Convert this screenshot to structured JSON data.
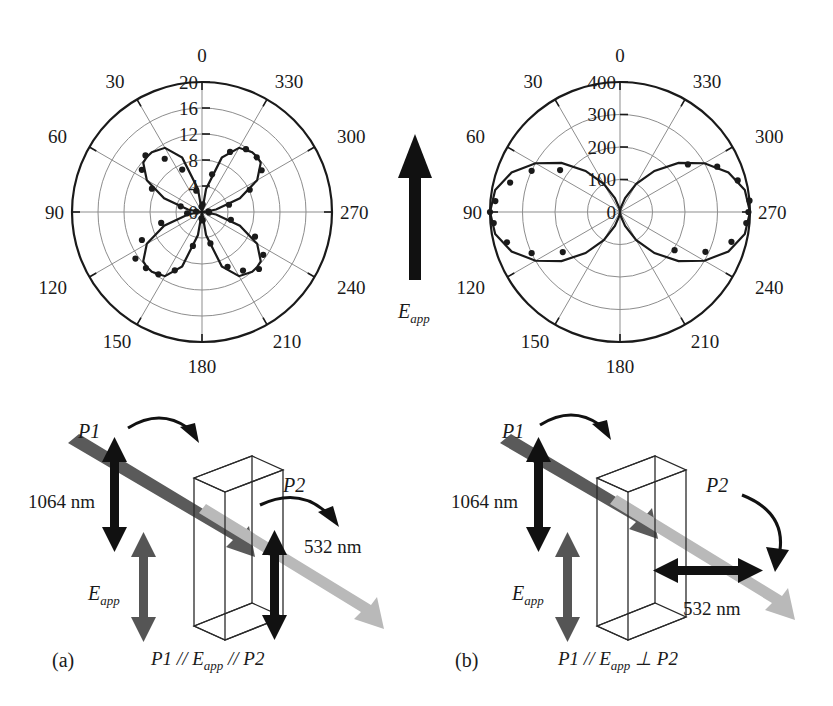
{
  "figure": {
    "panels": [
      {
        "id": "a",
        "panel_label": "(a)",
        "caption_main": "P1 // E",
        "caption_sub": "app",
        "caption_tail": " // P2",
        "p1_label": "P1",
        "p2_label": "P2",
        "eapp_label": "E",
        "eapp_sub": "app",
        "input_wavelength": "1064 nm",
        "output_wavelength": "532 nm",
        "p2_orientation": "vertical"
      },
      {
        "id": "b",
        "panel_label": "(b)",
        "caption_main": "P1 // E",
        "caption_sub": "app",
        "caption_tail": " ⊥ P2",
        "p1_label": "P1",
        "p2_label": "P2",
        "eapp_label": "E",
        "eapp_sub": "app",
        "input_wavelength": "1064 nm",
        "output_wavelength": "532 nm",
        "p2_orientation": "horizontal"
      }
    ],
    "center_arrow": {
      "label": "E",
      "sub": "app",
      "direction": "up"
    },
    "colors": {
      "ink": "#1a1a1a",
      "grid": "#8d8d8d",
      "beam_ir": "#5a5a5a",
      "beam_green": "#b9b9b9",
      "arrow_black": "#111111",
      "arrow_gray": "#555555"
    }
  },
  "chart_data": [
    {
      "type": "line",
      "plot_id": "polar-left",
      "polar": true,
      "title": "",
      "angle_unit": "degrees",
      "angle_direction": "clockwise",
      "angle_zero_at": "top",
      "angle_ticks": [
        0,
        30,
        60,
        90,
        120,
        150,
        180,
        210,
        240,
        270,
        300,
        330
      ],
      "angle_tick_labels": [
        "0",
        "30",
        "60",
        "90",
        "120",
        "150",
        "180",
        "210",
        "240",
        "270",
        "300",
        "330"
      ],
      "radial_ticks": [
        0,
        4,
        8,
        12,
        16,
        20
      ],
      "radial_tick_labels": [
        "0",
        "4",
        "8",
        "12",
        "16",
        "20"
      ],
      "rlim": [
        0,
        20
      ],
      "grid": true,
      "legend": "none",
      "series": [
        {
          "name": "fit-curve",
          "style": "solid-line",
          "model": "four-lobe clover, peak 12 at 45,135,225,315",
          "theta": [
            0,
            10,
            20,
            30,
            40,
            45,
            50,
            60,
            70,
            80,
            90,
            100,
            110,
            120,
            130,
            135,
            140,
            150,
            160,
            170,
            180,
            190,
            200,
            210,
            220,
            225,
            230,
            240,
            250,
            260,
            270,
            280,
            290,
            300,
            310,
            315,
            320,
            330,
            340,
            350,
            360
          ],
          "r": [
            0,
            3.6,
            8.9,
            11.4,
            12.0,
            12.0,
            11.8,
            9.8,
            6.2,
            2.2,
            0.2,
            2.2,
            6.2,
            9.8,
            11.8,
            12.0,
            12.0,
            11.4,
            8.9,
            3.6,
            0,
            3.6,
            8.9,
            11.4,
            12.0,
            12.0,
            11.8,
            9.8,
            6.2,
            2.2,
            0.2,
            2.2,
            6.2,
            9.8,
            11.8,
            12.0,
            12.0,
            11.4,
            8.9,
            3.6,
            0
          ]
        },
        {
          "name": "measured-points",
          "style": "filled-circles",
          "theta": [
            5,
            15,
            25,
            35,
            45,
            55,
            65,
            75,
            85,
            95,
            105,
            115,
            125,
            135,
            145,
            155,
            165,
            175,
            185,
            195,
            205,
            215,
            225,
            235,
            245,
            255,
            265,
            275,
            285,
            295,
            305,
            315,
            325,
            335,
            345,
            355
          ],
          "r": [
            1.2,
            6.0,
            10.2,
            11.8,
            11.9,
            11.2,
            8.1,
            4.3,
            1.0,
            1.1,
            4.6,
            9.0,
            11.5,
            12.4,
            11.0,
            9.3,
            5.0,
            1.3,
            1.0,
            5.4,
            9.9,
            11.7,
            12.2,
            12.5,
            10.2,
            6.5,
            2.3,
            0.9,
            3.4,
            8.5,
            11.3,
            12.3,
            10.0,
            7.2,
            3.4,
            0.8
          ]
        }
      ]
    },
    {
      "type": "line",
      "plot_id": "polar-right",
      "polar": true,
      "title": "",
      "angle_unit": "degrees",
      "angle_direction": "clockwise",
      "angle_zero_at": "top",
      "angle_ticks": [
        0,
        30,
        60,
        90,
        120,
        150,
        180,
        210,
        240,
        270,
        300,
        330
      ],
      "angle_tick_labels": [
        "0",
        "30",
        "60",
        "90",
        "120",
        "150",
        "180",
        "210",
        "240",
        "270",
        "300",
        "330"
      ],
      "radial_ticks": [
        0,
        100,
        200,
        300,
        400
      ],
      "radial_tick_labels": [
        "0",
        "100",
        "200",
        "300",
        "400"
      ],
      "rlim": [
        0,
        400
      ],
      "grid": true,
      "legend": "none",
      "series": [
        {
          "name": "fit-curve",
          "style": "solid-line",
          "model": "two-lobe figure-eight along 90-270 axis, peak 400",
          "theta": [
            0,
            10,
            20,
            30,
            40,
            50,
            60,
            70,
            80,
            90,
            100,
            110,
            120,
            130,
            140,
            150,
            160,
            170,
            180,
            190,
            200,
            210,
            220,
            230,
            240,
            250,
            260,
            270,
            280,
            290,
            300,
            310,
            320,
            330,
            340,
            350,
            360
          ],
          "r": [
            0,
            12,
            46,
            100,
            165,
            235,
            300,
            355,
            390,
            400,
            390,
            355,
            300,
            235,
            165,
            100,
            46,
            12,
            0,
            12,
            46,
            100,
            165,
            235,
            300,
            355,
            390,
            400,
            390,
            355,
            300,
            235,
            165,
            100,
            46,
            12,
            0
          ]
        },
        {
          "name": "measured-points",
          "style": "filled-circles",
          "theta": [
            55,
            65,
            75,
            85,
            90,
            95,
            105,
            115,
            125,
            235,
            245,
            255,
            265,
            270,
            275,
            285,
            295,
            305
          ],
          "r": [
            255,
            330,
            375,
            400,
            395,
            390,
            355,
            290,
            205,
            215,
            300,
            360,
            390,
            400,
            385,
            350,
            300,
            225
          ]
        }
      ]
    }
  ]
}
